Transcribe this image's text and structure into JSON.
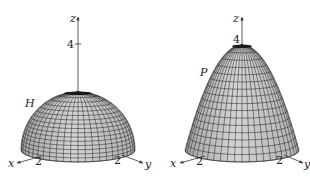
{
  "figures": [
    {
      "id": "hemisphere",
      "surface_label": "H",
      "axes": {
        "x": "x",
        "y": "y",
        "z": "z"
      },
      "ticks": {
        "z": "4",
        "x": "2",
        "y": "2"
      },
      "center_x": 78,
      "top_y": 92,
      "base_y": 150,
      "half_width": 57,
      "rim_ry": 12
    },
    {
      "id": "paraboloid",
      "surface_label": "P",
      "axes": {
        "x": "x",
        "y": "y",
        "z": "z"
      },
      "ticks": {
        "z": "4",
        "x": "2",
        "y": "2"
      },
      "center_x": 242,
      "top_y": 45,
      "base_y": 150,
      "half_width": 57,
      "rim_ry": 12
    }
  ],
  "colors": {
    "surface_fill": "#c8c8c8",
    "surface_shade": "#a9a9a9",
    "mesh": "#2a2a2a",
    "axis": "#333333"
  }
}
